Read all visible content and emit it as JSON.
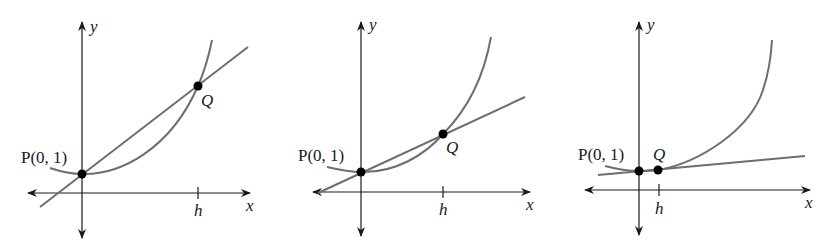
{
  "figure": {
    "colors": {
      "axis": "#1a1a1a",
      "curve": "#6e6e6e",
      "line": "#6e6e6e",
      "point": "#000000"
    },
    "panels": [
      {
        "id": "panel-1",
        "x_axis_label": "x",
        "y_axis_label": "y",
        "point_p_label": "P(0, 1)",
        "point_q_label": "Q",
        "tick_label": "h"
      },
      {
        "id": "panel-2",
        "x_axis_label": "x",
        "y_axis_label": "y",
        "point_p_label": "P(0, 1)",
        "point_q_label": "Q",
        "tick_label": "h"
      },
      {
        "id": "panel-3",
        "x_axis_label": "x",
        "y_axis_label": "y",
        "point_p_label": "P(0, 1)",
        "point_q_label": "Q",
        "tick_label": "h"
      }
    ]
  }
}
